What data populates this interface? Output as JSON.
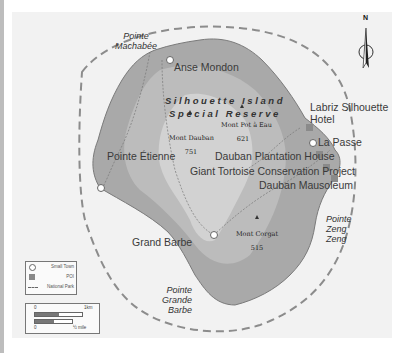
{
  "map": {
    "title": "Silhouette Island Special Reserve",
    "reserve_label_line1": "Silhouette Island",
    "reserve_label_line2": "Special Reserve",
    "colors": {
      "land_dark": "#a9a9a9",
      "land_mid": "#bcbcbc",
      "land_light": "#d3d3d3",
      "sea": "#f2f2f2",
      "park_boundary": "#888888",
      "poi": "#8a8a8a",
      "town": "#ffffff"
    },
    "compass": {
      "label": "N"
    },
    "towns": [
      {
        "name": "Anse Mondon"
      },
      {
        "name": "Pointe Étienne"
      },
      {
        "name": "La Passe"
      },
      {
        "name": "Grand Barbe"
      }
    ],
    "pois": [
      {
        "name": "Labriz Silhouette Hotel",
        "line1": "Labriz Silhouette",
        "line2": "Hotel"
      },
      {
        "name": "Dauban Plantation House"
      },
      {
        "name": "Giant Tortoise Conservation Project"
      },
      {
        "name": "Dauban Mausoleum"
      }
    ],
    "capes": [
      {
        "line1": "Pointe",
        "line2": "Machabée"
      },
      {
        "line1": "Pointe",
        "line2": "Zeng",
        "line3": "Zeng"
      },
      {
        "line1": "Pointe",
        "line2": "Grande",
        "line3": "Barbe"
      }
    ],
    "peaks": [
      {
        "name": "Mont Dauban",
        "elevation": "751"
      },
      {
        "name": "Mont Pot à Eau",
        "elevation": "621"
      },
      {
        "name": "Mont Corgat",
        "elevation": "515"
      }
    ]
  },
  "legend": {
    "items": [
      {
        "label": "Small Town",
        "symbol": "circle"
      },
      {
        "label": "POI",
        "symbol": "square"
      },
      {
        "label": "National Park",
        "symbol": "dashed-line"
      }
    ]
  },
  "scale": {
    "km_zero": "0",
    "km_label": "1km",
    "mile_zero": "0",
    "mile_label": "½ mile"
  }
}
